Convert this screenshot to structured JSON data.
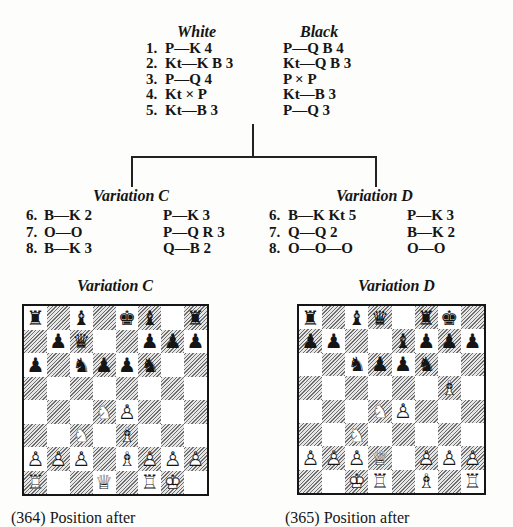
{
  "header": {
    "white_label": "White",
    "black_label": "Black"
  },
  "main_line": [
    {
      "num": "1.",
      "white": "P—K 4",
      "black": "P—Q B 4"
    },
    {
      "num": "2.",
      "white": "Kt—K B 3",
      "black": "Kt—Q B 3"
    },
    {
      "num": "3.",
      "white": "P—Q 4",
      "black": "P × P"
    },
    {
      "num": "4.",
      "white": "Kt × P",
      "black": "Kt—B 3"
    },
    {
      "num": "5.",
      "white": "Kt—B 3",
      "black": "P—Q 3"
    }
  ],
  "variations": [
    {
      "title": "Variation C",
      "moves": [
        {
          "num": "6.",
          "white": "B—K 2",
          "black": "P—K 3"
        },
        {
          "num": "7.",
          "white": "O—O",
          "black": "P—Q R 3"
        },
        {
          "num": "8.",
          "white": "B—K 3",
          "black": "Q—B 2"
        }
      ]
    },
    {
      "title": "Variation D",
      "moves": [
        {
          "num": "6.",
          "white": "B—K Kt 5",
          "black": "P—K 3"
        },
        {
          "num": "7.",
          "white": "Q—Q 2",
          "black": "B—K 2"
        },
        {
          "num": "8.",
          "white": "O—O—O",
          "black": "O—O"
        }
      ]
    }
  ],
  "diagrams": [
    {
      "title": "Variation C",
      "caption": "(364) Position after",
      "ranks": [
        "r.b.kb.r",
        ".pq..ppp",
        "p.nppn..",
        "........",
        "...NP...",
        "..N.B...",
        "PPP.BPPP",
        "R..Q.RK."
      ]
    },
    {
      "title": "Variation D",
      "caption": "(365) Position after",
      "ranks": [
        "r.bq.rk.",
        "pp..bppp",
        "..nppn..",
        "......B.",
        "...NP...",
        "..N.....",
        "PPPQ.PPP",
        "..KR.B.R"
      ]
    }
  ],
  "piece_glyphs": {
    "filled": {
      "K": "♚",
      "Q": "♛",
      "R": "♜",
      "B": "♝",
      "N": "♞",
      "P": "♟"
    },
    "outline": {
      "K": "♔",
      "Q": "♕",
      "R": "♖",
      "B": "♗",
      "N": "♘",
      "P": "♙"
    },
    "names": {
      "K": "king",
      "Q": "queen",
      "R": "rook",
      "B": "bishop",
      "N": "knight",
      "P": "pawn"
    }
  },
  "colors": {
    "ink": "#151515",
    "paper": "#fdfdfc",
    "hatch": "#6e6e6e"
  }
}
